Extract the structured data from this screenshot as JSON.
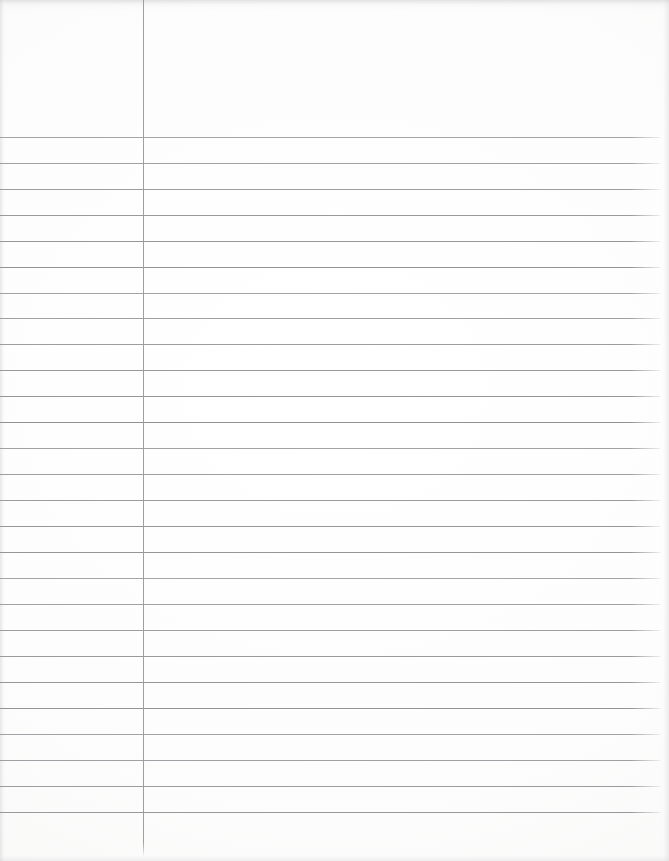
{
  "document": {
    "kind": "scanned-lined-notebook-paper",
    "page_width": 669,
    "page_height": 861,
    "background_color": "#fbfbfb",
    "has_visible_text": false,
    "body_text": "",
    "header_text": "",
    "footer_text": ""
  },
  "ruling": {
    "rule_color": "#8e8e92",
    "margin_rule_color": "#9a9a9e",
    "rule_thickness_px": 1,
    "first_rule_y": 137,
    "rule_spacing_px": 25.95,
    "rule_count": 27,
    "rule_left_x": 0,
    "rule_right_x": 660,
    "rule_y_positions": [
      137,
      163,
      189,
      215,
      241,
      267,
      293,
      318,
      344,
      370,
      396,
      422,
      448,
      474,
      500,
      526,
      552,
      578,
      604,
      630,
      656,
      682,
      708,
      734,
      760,
      786,
      812
    ]
  },
  "margin_rule": {
    "x": 143,
    "y_start": 0,
    "y_end": 856,
    "height": 856,
    "orientation": "vertical"
  },
  "header_area": {
    "top_blank_region_height": 137,
    "description": "blank unruled header space above the first rule"
  },
  "footer_area": {
    "bottom_blank_region_start": 812,
    "description": "blank unruled space below the last rule"
  }
}
